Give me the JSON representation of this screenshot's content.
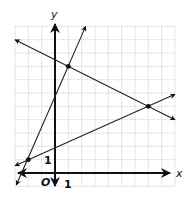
{
  "chart_data": {
    "type": "line",
    "title": "",
    "xlabel": "x",
    "ylabel": "y",
    "origin_label": "O",
    "tick_labels": {
      "x": "1",
      "y": "1"
    },
    "xlim": [
      -3,
      9
    ],
    "ylim": [
      -1,
      11
    ],
    "grid": true,
    "series": [
      {
        "name": "steep-line",
        "points": [
          [
            -2.9,
            -0.9
          ],
          [
            -2,
            1
          ],
          [
            1,
            8
          ],
          [
            2.3,
            11
          ]
        ],
        "slope": 2.333,
        "intercept": 5.667
      },
      {
        "name": "decreasing-line",
        "points": [
          [
            -3,
            10
          ],
          [
            1,
            8
          ],
          [
            7,
            5
          ],
          [
            9,
            4
          ]
        ],
        "slope": -0.5,
        "intercept": 8.5
      },
      {
        "name": "shallow-line",
        "points": [
          [
            -3,
            0.55
          ],
          [
            -2,
            1
          ],
          [
            7,
            5
          ],
          [
            9,
            5.9
          ]
        ],
        "slope": 0.444,
        "intercept": 1.889
      }
    ],
    "marked_points": [
      [
        -2,
        1
      ],
      [
        1,
        8
      ],
      [
        7,
        5
      ]
    ]
  },
  "labels": {
    "x_axis": "x",
    "y_axis": "y",
    "origin": "O",
    "x_tick": "1",
    "y_tick": "1"
  }
}
